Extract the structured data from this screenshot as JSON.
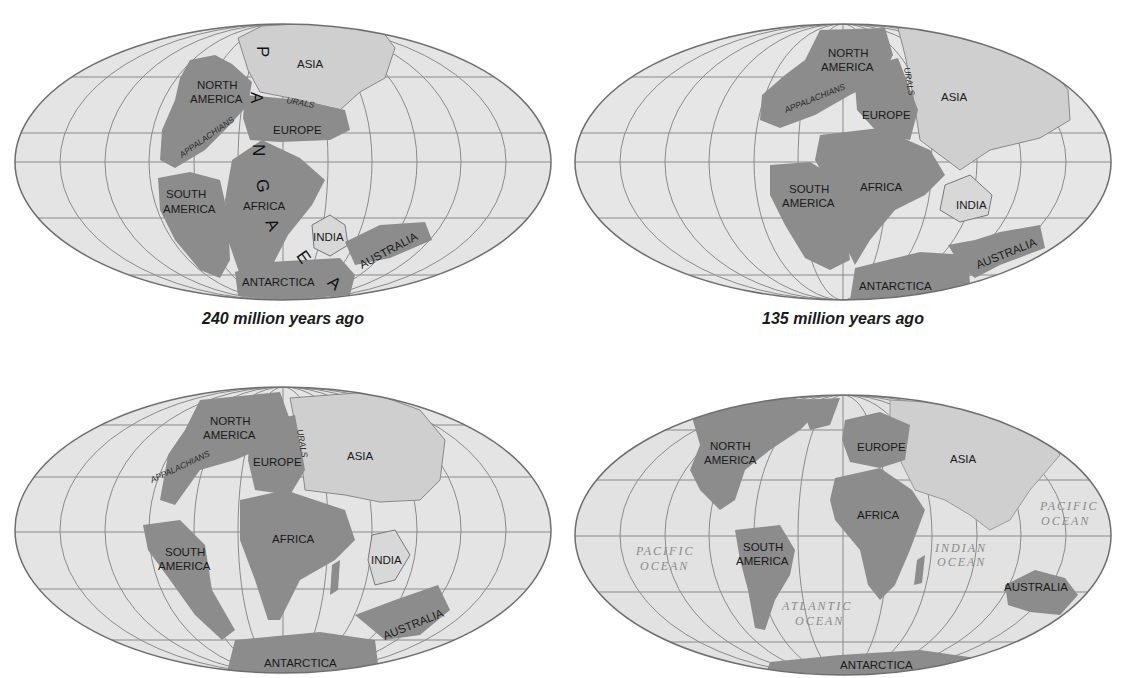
{
  "figure": {
    "panels": [
      {
        "caption": "240 million years ago",
        "labels": {
          "asia": "ASIA",
          "north_america_1": "NORTH",
          "north_america_2": "AMERICA",
          "urals": "URALS",
          "appalachians": "APPALACHIANS",
          "europe": "EUROPE",
          "south_america_1": "SOUTH",
          "south_america_2": "AMERICA",
          "africa": "AFRICA",
          "india": "INDIA",
          "australia": "AUSTRALIA",
          "antarctica": "ANTARCTICA",
          "pangaea_letters": [
            "P",
            "A",
            "N",
            "G",
            "A",
            "E",
            "A"
          ]
        }
      },
      {
        "caption": "135 million years ago",
        "labels": {
          "north_america_1": "NORTH",
          "north_america_2": "AMERICA",
          "urals": "URALS",
          "appalachians": "APPALACHIANS",
          "asia": "ASIA",
          "europe": "EUROPE",
          "south_america_1": "SOUTH",
          "south_america_2": "AMERICA",
          "africa": "AFRICA",
          "india": "INDIA",
          "australia": "AUSTRALIA",
          "antarctica": "ANTARCTICA"
        }
      },
      {
        "caption": "",
        "labels": {
          "north_america_1": "NORTH",
          "north_america_2": "AMERICA",
          "urals": "URALS",
          "appalachians": "APPALACHIANS",
          "europe": "EUROPE",
          "asia": "ASIA",
          "south_america_1": "SOUTH",
          "south_america_2": "AMERICA",
          "africa": "AFRICA",
          "india": "INDIA",
          "australia": "AUSTRALIA",
          "antarctica": "ANTARCTICA"
        }
      },
      {
        "caption": "",
        "labels": {
          "north_america_1": "NORTH",
          "north_america_2": "AMERICA",
          "europe": "EUROPE",
          "asia": "ASIA",
          "africa": "AFRICA",
          "south_america_1": "SOUTH",
          "south_america_2": "AMERICA",
          "australia": "AUSTRALIA",
          "antarctica": "ANTARCTICA",
          "pacific_west_1": "PACIFIC",
          "pacific_west_2": "OCEAN",
          "pacific_east_1": "PACIFIC",
          "pacific_east_2": "OCEAN",
          "indian_1": "INDIAN",
          "indian_2": "OCEAN",
          "atlantic_1": "ATLANTIC",
          "atlantic_2": "OCEAN"
        }
      }
    ],
    "colors": {
      "ocean": "#e6e6e6",
      "land_dark": "#8c8c8c",
      "land_light": "#cfcfcf",
      "grid": "#8a8a8a",
      "outline": "#6e6e6e"
    }
  }
}
